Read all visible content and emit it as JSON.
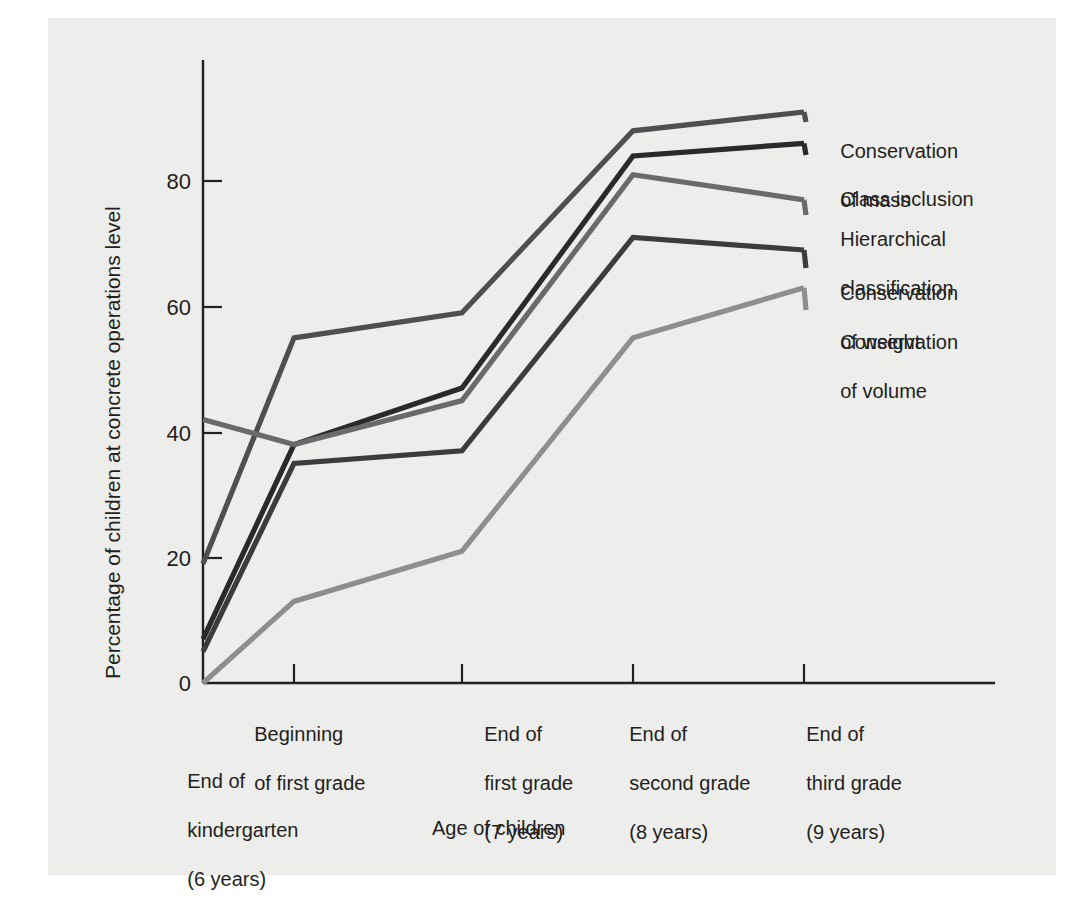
{
  "chart_data": {
    "type": "line",
    "title": "",
    "xlabel": "Age of children",
    "ylabel": "Percentage of children at concrete operations level",
    "ylim": [
      0,
      100
    ],
    "yticks": [
      0,
      20,
      40,
      60,
      80
    ],
    "ytick_labels": [
      "0",
      "20",
      "40",
      "60",
      "80"
    ],
    "grid": false,
    "legend_position": "right-of-plot",
    "categories": [
      "End of kindergarten (6 years)",
      "Beginning of first grade",
      "End of first grade (7 years)",
      "End of second grade (8 years)",
      "End of third grade (9 years)"
    ],
    "x_index": [
      0,
      1,
      2,
      3,
      4
    ],
    "series": [
      {
        "name": "Conservation of mass",
        "color": "#4f4f4f",
        "values": [
          19,
          55,
          59,
          88,
          91
        ]
      },
      {
        "name": "Class inclusion",
        "color": "#2a2a2a",
        "values": [
          7,
          38,
          47,
          84,
          86
        ]
      },
      {
        "name": "Hierarchical classification",
        "color": "#6a6a6a",
        "values": [
          42,
          38,
          45,
          81,
          77
        ]
      },
      {
        "name": "Conservation of weight",
        "color": "#3c3c3c",
        "values": [
          5,
          35,
          37,
          71,
          69
        ]
      },
      {
        "name": "Conservation of volume",
        "color": "#8e8e8e",
        "values": [
          0,
          13,
          21,
          55,
          63
        ]
      }
    ]
  },
  "axes": {
    "y_tick_labels": [
      "80",
      "60",
      "40",
      "20",
      "0"
    ],
    "y_axis_title": "Percentage of children at concrete operations level",
    "x_axis_title": "Age of children",
    "x_tick_labels": [
      {
        "line1": "Beginning",
        "line2": "of first grade",
        "line3": ""
      },
      {
        "line1": "End of",
        "line2": "first grade",
        "line3": "(7 years)"
      },
      {
        "line1": "End of",
        "line2": "second grade",
        "line3": "(8 years)"
      },
      {
        "line1": "End of",
        "line2": "third grade",
        "line3": "(9 years)"
      }
    ],
    "origin_label": {
      "line1": "End of",
      "line2": "kindergarten",
      "line3": "(6 years)"
    }
  },
  "legend": {
    "entries": [
      {
        "line1": "Conservation",
        "line2": "of mass",
        "color": "#4f4f4f"
      },
      {
        "line1": "Class inclusion",
        "line2": "",
        "color": "#2a2a2a"
      },
      {
        "line1": "Hierarchical",
        "line2": "classification",
        "color": "#6a6a6a"
      },
      {
        "line1": "Conservation",
        "line2": "of weight",
        "color": "#3c3c3c"
      },
      {
        "line1": "Conservation",
        "line2": "of volume",
        "color": "#8e8e8e"
      }
    ]
  }
}
